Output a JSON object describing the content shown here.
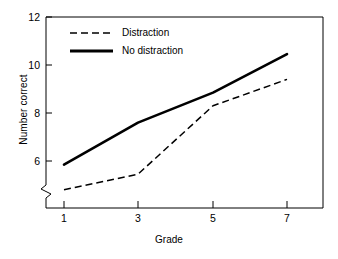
{
  "chart_data": {
    "type": "line",
    "title": "",
    "xlabel": "Grade",
    "ylabel": "Number correct",
    "x": [
      1,
      3,
      5,
      7
    ],
    "xtick_labels": [
      "1",
      "3",
      "5",
      "7"
    ],
    "ytick_labels": [
      "6",
      "8",
      "10",
      "12"
    ],
    "yticks": [
      6,
      8,
      10,
      12
    ],
    "xlim": [
      0,
      8
    ],
    "ylim": [
      4.4,
      12
    ],
    "grid": false,
    "axis_break": true,
    "axis_break_axis": "y",
    "legend_position": "upper-left-inside",
    "series": [
      {
        "name": "Distraction",
        "style": "dashed",
        "color": "#000000",
        "values": [
          4.8,
          5.45,
          8.3,
          9.4
        ]
      },
      {
        "name": "No distraction",
        "style": "solid",
        "color": "#000000",
        "values": [
          5.85,
          7.6,
          8.85,
          10.45
        ]
      }
    ]
  },
  "axes": {
    "y_label": "Number correct",
    "x_label": "Grade",
    "y_tick_0": "6",
    "y_tick_1": "8",
    "y_tick_2": "10",
    "y_tick_3": "12",
    "x_tick_0": "1",
    "x_tick_1": "3",
    "x_tick_2": "5",
    "x_tick_3": "7"
  },
  "legend": {
    "entry_0": "Distraction",
    "entry_1": "No distraction"
  },
  "colors": {
    "ink": "#000000",
    "background": "#ffffff"
  }
}
